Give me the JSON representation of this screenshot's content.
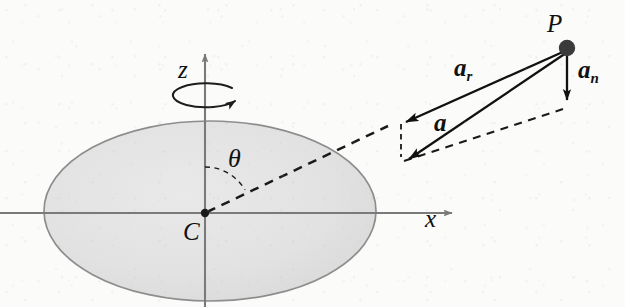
{
  "figure": {
    "background_color": "#fbfbfa",
    "ellipse_fill": "#e2e2e2",
    "ellipse_stroke": "#8d8d8d",
    "axis_color": "#7a7a7a",
    "vector_color": "#111111",
    "dashed_color": "#1a1a1a"
  },
  "labels": {
    "z_axis": "z",
    "x_axis": "x",
    "center": "C",
    "point_p": "P",
    "theta": "θ",
    "vector_a": "a",
    "vector_ar_base": "a",
    "vector_ar_sub": "r",
    "vector_an_base": "a",
    "vector_an_sub": "n"
  },
  "geometry": {
    "center": {
      "x": 205,
      "y": 213
    },
    "ellipse": {
      "cx": 210,
      "cy": 211,
      "rx": 166,
      "ry": 90
    },
    "z_axis": {
      "x": 205,
      "y_top": 46,
      "y_bottom": 307
    },
    "x_axis": {
      "y": 213,
      "x_left": 0,
      "x_right": 460
    },
    "point_p": {
      "x": 567,
      "y": 48
    },
    "arrow_a_tip": {
      "x": 402,
      "y": 160
    },
    "arrow_ar_tip": {
      "x": 400,
      "y": 121
    },
    "arrow_an_tip": {
      "x": 567,
      "y": 107
    },
    "spin_indicator": {
      "cx": 205,
      "cy": 95,
      "rx": 33,
      "ry": 12
    },
    "theta_arc_radius": 46
  },
  "elements": [
    {
      "name": "ellipse-body",
      "kind": "shaded-ellipse"
    },
    {
      "name": "z-axis",
      "kind": "arrow-axis"
    },
    {
      "name": "x-axis",
      "kind": "arrow-axis"
    },
    {
      "name": "spin-arrow",
      "kind": "rotation-indicator"
    },
    {
      "name": "theta-arc",
      "kind": "dashed-arc"
    },
    {
      "name": "radial-dashed-line",
      "kind": "dashed-line"
    },
    {
      "name": "vector-a",
      "kind": "solid-arrow"
    },
    {
      "name": "vector-ar",
      "kind": "solid-arrow"
    },
    {
      "name": "vector-an",
      "kind": "solid-arrow"
    },
    {
      "name": "parallelogram-dashed",
      "kind": "dashed-line"
    },
    {
      "name": "point-p-marker",
      "kind": "filled-dot"
    },
    {
      "name": "point-c-marker",
      "kind": "filled-dot"
    }
  ]
}
